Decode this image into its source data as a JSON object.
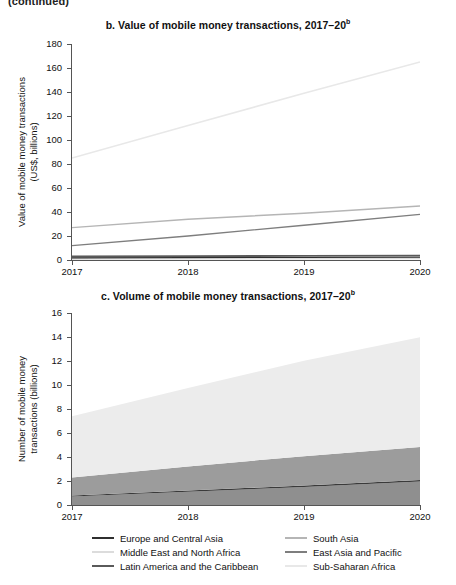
{
  "page": {
    "continued_note": "(continued)"
  },
  "legend": {
    "position": "bottom",
    "columns": [
      [
        {
          "label": "Europe and Central Asia",
          "color": "#2f2f2f"
        },
        {
          "label": "Middle East and North Africa",
          "color": "#dcdcdc"
        },
        {
          "label": "Latin America and the Caribbean",
          "color": "#5a5a5a"
        }
      ],
      [
        {
          "label": "South Asia",
          "color": "#b5b5b5"
        },
        {
          "label": "East Asia and Pacific",
          "color": "#7e7e7e"
        },
        {
          "label": "Sub-Saharan Africa",
          "color": "#e8e8e8"
        }
      ]
    ]
  },
  "chart_data": [
    {
      "id": "panel-b",
      "type": "line",
      "title": "b. Value of mobile money transactions, 2017–20",
      "title_superscript": "b",
      "xlabel": "",
      "ylabel": "Value of mobile money transactions\n(US$, billions)",
      "x": [
        2017,
        2018,
        2019,
        2020
      ],
      "xticklabels": [
        "2017",
        "2018",
        "2019",
        "2020"
      ],
      "yticks": [
        0,
        20,
        40,
        60,
        80,
        100,
        120,
        140,
        160,
        180
      ],
      "ylim": [
        0,
        180
      ],
      "grid": false,
      "series": [
        {
          "name": "Sub-Saharan Africa",
          "color": "#e8e8e8",
          "width": 1.6,
          "values": [
            85,
            112,
            139,
            165
          ]
        },
        {
          "name": "South Asia",
          "color": "#b5b5b5",
          "width": 1.4,
          "values": [
            27,
            34,
            39,
            45
          ]
        },
        {
          "name": "East Asia and Pacific",
          "color": "#7e7e7e",
          "width": 1.4,
          "values": [
            12,
            20,
            29,
            38
          ]
        },
        {
          "name": "Latin America and the Caribbean",
          "color": "#5a5a5a",
          "width": 1.8,
          "values": [
            3.0,
            3.2,
            3.4,
            3.6
          ]
        },
        {
          "name": "Europe and Central Asia",
          "color": "#2f2f2f",
          "width": 1.8,
          "values": [
            1.6,
            1.7,
            1.8,
            2.0
          ]
        },
        {
          "name": "Middle East and North Africa",
          "color": "#dcdcdc",
          "width": 1.4,
          "values": [
            0.7,
            0.9,
            1.1,
            1.3
          ]
        }
      ]
    },
    {
      "id": "panel-c",
      "type": "area",
      "stacked": true,
      "title": "c. Volume of mobile money transactions, 2017–20",
      "title_superscript": "b",
      "xlabel": "",
      "ylabel": "Number of mobile money\ntransactions (billions)",
      "x": [
        2017,
        2018,
        2019,
        2020
      ],
      "xticklabels": [
        "2017",
        "2018",
        "2019",
        "2020"
      ],
      "yticks": [
        0,
        2,
        4,
        6,
        8,
        10,
        12,
        14,
        16
      ],
      "ylim": [
        0,
        16
      ],
      "grid": false,
      "series": [
        {
          "name": "South Asia",
          "color": "#8f8f8f",
          "values": [
            0.7,
            1.1,
            1.5,
            1.95
          ]
        },
        {
          "name": "East Asia and Pacific",
          "color": "#3a3a3a",
          "values": [
            0.1,
            0.11,
            0.12,
            0.13
          ]
        },
        {
          "name": "Latin America and the Caribbean",
          "color": "#9c9c9c",
          "values": [
            1.5,
            2.0,
            2.45,
            2.75
          ]
        },
        {
          "name": "Sub-Saharan Africa",
          "color": "#ececec",
          "values": [
            5.1,
            6.55,
            7.95,
            9.15
          ]
        }
      ]
    }
  ]
}
